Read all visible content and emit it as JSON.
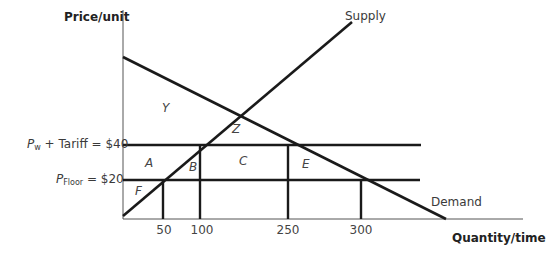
{
  "axes": {
    "y_label": "Price/unit",
    "x_label": "Quantity/time"
  },
  "price_lines": [
    {
      "id": "pw_tariff",
      "prefix": "P",
      "sub": "w",
      "suffix": " + Tariff = $40",
      "value": 40
    },
    {
      "id": "floor",
      "prefix": "P",
      "sub": "Floor",
      "suffix": " = $20",
      "value": 20
    }
  ],
  "x_ticks": [
    "50",
    "100",
    "250",
    "300"
  ],
  "curves": {
    "supply_label": "Supply",
    "demand_label": "Demand"
  },
  "regions": {
    "Y": "Y",
    "Z": "Z",
    "A": "A",
    "B": "B",
    "C": "C",
    "E": "E",
    "F": "F"
  },
  "colors": {
    "line": "#1a1a1a",
    "axis": "#555555",
    "text": "#3a3a3a"
  }
}
